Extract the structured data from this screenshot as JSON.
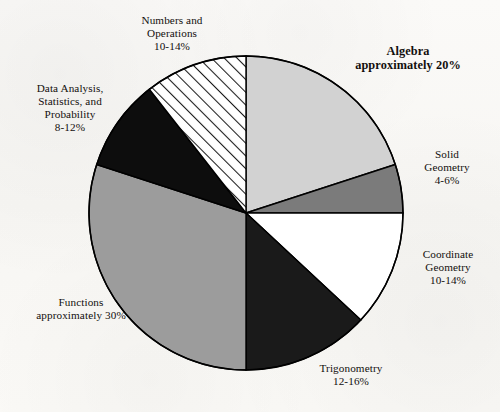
{
  "chart_data": {
    "type": "pie",
    "title": "",
    "subtitle": "",
    "xlabel": "",
    "ylabel": "",
    "grid": false,
    "legend_position": "none",
    "label_placement": "outside-callout",
    "start_angle_deg": 0,
    "direction": "clockwise",
    "center": {
      "x": 246,
      "y": 213
    },
    "radius": 157,
    "categories": [
      "Algebra",
      "Solid Geometry",
      "Coordinate Geometry",
      "Trigonometry",
      "Functions",
      "Data Analysis, Statistics, and Probability",
      "Numbers and Operations"
    ],
    "values": [
      20,
      5,
      12,
      14,
      30,
      10,
      12
    ],
    "value_labels": [
      "approximately 20%",
      "4-6%",
      "10-14%",
      "12-16%",
      "approximately 30%",
      "8-12%",
      "10-14%"
    ],
    "slices": [
      {
        "name": "Algebra",
        "label_lines": [
          "Algebra",
          "approximately 20%"
        ],
        "value": 20,
        "value_text": "approximately 20%",
        "start_deg": 0,
        "end_deg": 72,
        "fill": "#d2d2d2",
        "fill_style": "solid",
        "emphasis": true
      },
      {
        "name": "Solid Geometry",
        "label_lines": [
          "Solid",
          "Geometry",
          "4-6%"
        ],
        "value": 5,
        "value_text": "4-6%",
        "start_deg": 72,
        "end_deg": 90,
        "fill": "#7b7b7b",
        "fill_style": "solid",
        "emphasis": false
      },
      {
        "name": "Coordinate Geometry",
        "label_lines": [
          "Coordinate",
          "Geometry",
          "10-14%"
        ],
        "value": 12,
        "value_text": "10-14%",
        "start_deg": 90,
        "end_deg": 133,
        "fill": "#ffffff",
        "fill_style": "solid",
        "emphasis": false
      },
      {
        "name": "Trigonometry",
        "label_lines": [
          "Trigonometry",
          "12-16%"
        ],
        "value": 14,
        "value_text": "12-16%",
        "start_deg": 133,
        "end_deg": 180,
        "fill": "#1a1a1a",
        "fill_style": "solid",
        "emphasis": false
      },
      {
        "name": "Functions",
        "label_lines": [
          "Functions",
          "approximately 30%"
        ],
        "value": 30,
        "value_text": "approximately 30%",
        "start_deg": 180,
        "end_deg": 288,
        "fill": "#9c9c9c",
        "fill_style": "solid",
        "emphasis": false
      },
      {
        "name": "Data Analysis, Statistics, and Probability",
        "label_lines": [
          "Data Analysis,",
          "Statistics, and",
          "Probability",
          "8-12%"
        ],
        "value": 10,
        "value_text": "8-12%",
        "start_deg": 288,
        "end_deg": 322,
        "fill": "#0d0d0d",
        "fill_style": "solid",
        "emphasis": false
      },
      {
        "name": "Numbers and Operations",
        "label_lines": [
          "Numbers and",
          "Operations",
          "10-14%"
        ],
        "value": 12,
        "value_text": "10-14%",
        "start_deg": 322,
        "end_deg": 360,
        "fill": "#ffffff",
        "fill_style": "diagonal-hatch",
        "emphasis": false
      }
    ],
    "colors": {
      "outline": "#000000",
      "background": "#fbfaf8",
      "text": "#120f0d"
    }
  }
}
